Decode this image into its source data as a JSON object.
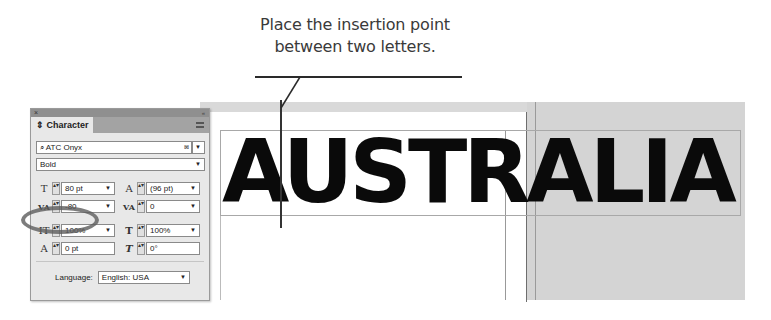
{
  "callout": {
    "line1": "Place the insertion point",
    "line2": "between two letters."
  },
  "canvas": {
    "headline": "AUSTRALIA"
  },
  "panel": {
    "title": "Character",
    "close_icon": "×",
    "collapse_icon": "«",
    "font_family": {
      "search_icon": "⌕",
      "value": "ATC Onyx",
      "clear_icon": "⊠",
      "dropdown_icon": "▼"
    },
    "font_style": {
      "value": "Bold",
      "dropdown_icon": "▼"
    },
    "font_size": {
      "icon": "T",
      "value": "80 pt"
    },
    "leading": {
      "icon": "A",
      "value": "(96 pt)"
    },
    "kerning": {
      "icon": "VA",
      "value": "-80"
    },
    "tracking": {
      "icon": "VA",
      "value": "0"
    },
    "vertical_scale": {
      "icon": "IT",
      "value": "100%"
    },
    "horizontal_scale": {
      "icon": "T",
      "value": "100%"
    },
    "baseline_shift": {
      "icon": "A",
      "value": "0 pt"
    },
    "skew": {
      "icon": "T",
      "value": "0°"
    },
    "language": {
      "label": "Language:",
      "value": "English: USA"
    },
    "stepper_glyph": "▴▾",
    "dropdown_glyph": "▼"
  }
}
